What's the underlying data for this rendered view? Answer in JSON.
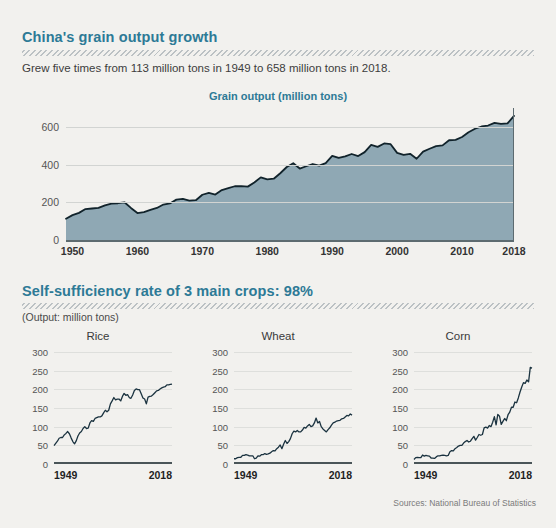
{
  "theme": {
    "background": "#f2f1ee",
    "accent": "#2d7a96",
    "area_fill": "#8fa8b4",
    "line_stroke": "#11232b",
    "grid": "#d2d4d2"
  },
  "section1": {
    "title": "China's grain output growth",
    "subtitle": "Grew five times from 113 million tons in 1949 to 658 million tons in 2018.",
    "legend": "Grain output (million tons)"
  },
  "section2": {
    "title": "Self-sufficiency rate of 3 main crops: 98%",
    "subtitle": "(Output: million tons)"
  },
  "sources": "Sources: National Bureau of Statistics",
  "chart_data": [
    {
      "type": "area",
      "title": "Grain output (million tons)",
      "xlabel": "",
      "ylabel": "",
      "ylim": [
        0,
        700
      ],
      "xlim": [
        1949,
        2018
      ],
      "grid": true,
      "yticks": [
        0,
        200,
        400,
        600
      ],
      "xticks": [
        1950,
        1960,
        1970,
        1980,
        1990,
        2000,
        2010,
        2018
      ],
      "x": [
        1949,
        1950,
        1951,
        1952,
        1953,
        1954,
        1955,
        1956,
        1957,
        1958,
        1959,
        1960,
        1961,
        1962,
        1963,
        1964,
        1965,
        1966,
        1967,
        1968,
        1969,
        1970,
        1971,
        1972,
        1973,
        1974,
        1975,
        1976,
        1977,
        1978,
        1979,
        1980,
        1981,
        1982,
        1983,
        1984,
        1985,
        1986,
        1987,
        1988,
        1989,
        1990,
        1991,
        1992,
        1993,
        1994,
        1995,
        1996,
        1997,
        1998,
        1999,
        2000,
        2001,
        2002,
        2003,
        2004,
        2005,
        2006,
        2007,
        2008,
        2009,
        2010,
        2011,
        2012,
        2013,
        2014,
        2015,
        2016,
        2017,
        2018
      ],
      "values": [
        113,
        132,
        144,
        164,
        167,
        170,
        184,
        193,
        195,
        200,
        170,
        143,
        148,
        160,
        170,
        188,
        194,
        214,
        218,
        209,
        211,
        240,
        250,
        241,
        265,
        275,
        285,
        286,
        283,
        305,
        332,
        321,
        325,
        354,
        387,
        407,
        379,
        391,
        403,
        394,
        408,
        446,
        435,
        443,
        456,
        445,
        466,
        504,
        494,
        512,
        508,
        462,
        452,
        457,
        431,
        469,
        484,
        498,
        502,
        529,
        531,
        546,
        571,
        590,
        602,
        607,
        621,
        616,
        618,
        658
      ]
    },
    {
      "type": "line",
      "title": "Rice",
      "ylim": [
        0,
        300
      ],
      "yticks": [
        0,
        50,
        100,
        150,
        200,
        250,
        300
      ],
      "xlim": [
        1949,
        2018
      ],
      "xticks": [
        1949,
        2018
      ],
      "grid": true,
      "x": [
        1949,
        1950,
        1951,
        1952,
        1953,
        1954,
        1955,
        1956,
        1957,
        1958,
        1959,
        1960,
        1961,
        1962,
        1963,
        1964,
        1965,
        1966,
        1967,
        1968,
        1969,
        1970,
        1971,
        1972,
        1973,
        1974,
        1975,
        1976,
        1977,
        1978,
        1979,
        1980,
        1981,
        1982,
        1983,
        1984,
        1985,
        1986,
        1987,
        1988,
        1989,
        1990,
        1991,
        1992,
        1993,
        1994,
        1995,
        1996,
        1997,
        1998,
        1999,
        2000,
        2001,
        2002,
        2003,
        2004,
        2005,
        2006,
        2007,
        2008,
        2009,
        2010,
        2011,
        2012,
        2013,
        2014,
        2015,
        2016,
        2017,
        2018
      ],
      "values": [
        49,
        55,
        61,
        69,
        71,
        71,
        78,
        82,
        87,
        81,
        70,
        60,
        54,
        62,
        75,
        83,
        87,
        95,
        100,
        95,
        96,
        110,
        116,
        114,
        122,
        124,
        126,
        126,
        129,
        137,
        144,
        140,
        144,
        161,
        169,
        178,
        172,
        174,
        174,
        169,
        181,
        189,
        184,
        186,
        178,
        176,
        185,
        197,
        201,
        199,
        199,
        188,
        177,
        174,
        161,
        179,
        181,
        182,
        186,
        191,
        196,
        197,
        201,
        204,
        206,
        207,
        212,
        212,
        213,
        214
      ]
    },
    {
      "type": "line",
      "title": "Wheat",
      "ylim": [
        0,
        300
      ],
      "yticks": [
        0,
        50,
        100,
        150,
        200,
        250,
        300
      ],
      "xlim": [
        1949,
        2018
      ],
      "xticks": [
        1949,
        2018
      ],
      "grid": true,
      "x": [
        1949,
        1950,
        1951,
        1952,
        1953,
        1954,
        1955,
        1956,
        1957,
        1958,
        1959,
        1960,
        1961,
        1962,
        1963,
        1964,
        1965,
        1966,
        1967,
        1968,
        1969,
        1970,
        1971,
        1972,
        1973,
        1974,
        1975,
        1976,
        1977,
        1978,
        1979,
        1980,
        1981,
        1982,
        1983,
        1984,
        1985,
        1986,
        1987,
        1988,
        1989,
        1990,
        1991,
        1992,
        1993,
        1994,
        1995,
        1996,
        1997,
        1998,
        1999,
        2000,
        2001,
        2002,
        2003,
        2004,
        2005,
        2006,
        2007,
        2008,
        2009,
        2010,
        2011,
        2012,
        2013,
        2014,
        2015,
        2016,
        2017,
        2018
      ],
      "values": [
        14,
        14,
        17,
        18,
        18,
        23,
        23,
        25,
        24,
        22,
        22,
        22,
        14,
        16,
        22,
        21,
        25,
        25,
        28,
        26,
        27,
        29,
        33,
        36,
        35,
        41,
        45,
        51,
        41,
        53,
        63,
        55,
        60,
        68,
        81,
        88,
        86,
        90,
        86,
        86,
        91,
        98,
        96,
        102,
        106,
        100,
        102,
        110,
        123,
        110,
        114,
        100,
        94,
        90,
        86,
        92,
        97,
        104,
        110,
        112,
        115,
        116,
        117,
        121,
        122,
        126,
        130,
        129,
        134,
        131
      ]
    },
    {
      "type": "line",
      "title": "Corn",
      "ylim": [
        0,
        300
      ],
      "yticks": [
        0,
        50,
        100,
        150,
        200,
        250,
        300
      ],
      "xlim": [
        1949,
        2018
      ],
      "xticks": [
        1949,
        2018
      ],
      "grid": true,
      "x": [
        1949,
        1950,
        1951,
        1952,
        1953,
        1954,
        1955,
        1956,
        1957,
        1958,
        1959,
        1960,
        1961,
        1962,
        1963,
        1964,
        1965,
        1966,
        1967,
        1968,
        1969,
        1970,
        1971,
        1972,
        1973,
        1974,
        1975,
        1976,
        1977,
        1978,
        1979,
        1980,
        1981,
        1982,
        1983,
        1984,
        1985,
        1986,
        1987,
        1988,
        1989,
        1990,
        1991,
        1992,
        1993,
        1994,
        1995,
        1996,
        1997,
        1998,
        1999,
        2000,
        2001,
        2002,
        2003,
        2004,
        2005,
        2006,
        2007,
        2008,
        2009,
        2010,
        2011,
        2012,
        2013,
        2014,
        2015,
        2016,
        2017,
        2018
      ],
      "values": [
        12,
        17,
        18,
        17,
        17,
        24,
        21,
        23,
        22,
        21,
        16,
        16,
        15,
        19,
        22,
        22,
        23,
        24,
        23,
        22,
        23,
        33,
        36,
        35,
        41,
        44,
        48,
        50,
        50,
        56,
        60,
        63,
        59,
        61,
        68,
        74,
        64,
        71,
        79,
        77,
        79,
        97,
        99,
        96,
        103,
        100,
        112,
        127,
        105,
        133,
        128,
        106,
        114,
        122,
        116,
        132,
        139,
        152,
        152,
        166,
        164,
        177,
        193,
        206,
        218,
        216,
        225,
        220,
        259,
        257
      ]
    }
  ],
  "small_charts_axis": {
    "left_year": "1949",
    "right_year": "2018"
  }
}
